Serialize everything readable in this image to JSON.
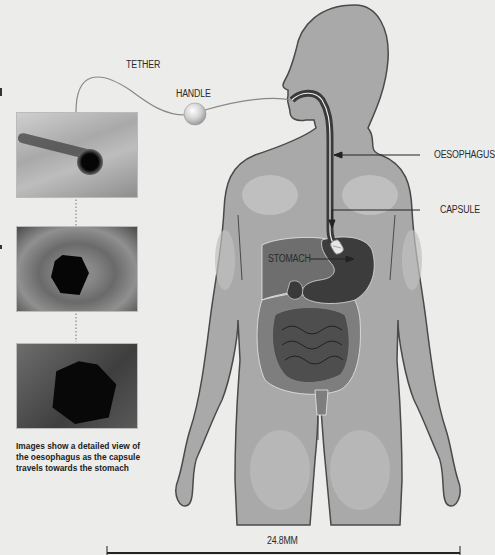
{
  "labels": {
    "tether": "TETHER",
    "handle": "HANDLE",
    "oesophagus": "OESOPHAGUS",
    "capsule": "CAPSULE",
    "stomach": "STOMACH",
    "scale": "24.8MM"
  },
  "caption": "Images show a detailed view of the oesophagus as the capsule travels towards the stomach",
  "photos": [
    {
      "name": "endoscopy-image-1",
      "description": "oesophagus wall with small dark opening"
    },
    {
      "name": "endoscopy-image-2",
      "description": "oesophagus lumen, larger dark opening"
    },
    {
      "name": "endoscopy-image-3",
      "description": "oesophagus lumen near stomach, wide dark opening"
    }
  ],
  "colors": {
    "background": "#ececea",
    "body": "#a9a9a9",
    "body_outline": "#4a4a4a",
    "stomach": "#3c3c3c",
    "intestine_large": "#7e7e7e",
    "intestine_small": "#4e4e4e",
    "tube": "#3a3a3a"
  }
}
